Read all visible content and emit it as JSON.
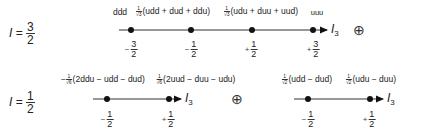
{
  "colors": {
    "line": "#333333",
    "dot": "#111111",
    "text": "#222222"
  },
  "row_i32": {
    "isospin_label": {
      "var": "I",
      "eq": "=",
      "num": "3",
      "den": "2"
    },
    "axis_label": {
      "var": "I",
      "sub": "3"
    },
    "states": [
      {
        "label": "ddd"
      },
      {
        "coef_num": "1",
        "coef_den": "√3",
        "label": "(udd + dud + ddu)"
      },
      {
        "coef_num": "1",
        "coef_den": "√3",
        "label": "(udu + duu + uud)"
      },
      {
        "label": "uuu"
      }
    ],
    "ticks": [
      {
        "sign": "−",
        "num": "3",
        "den": "2"
      },
      {
        "sign": "−",
        "num": "1",
        "den": "2"
      },
      {
        "sign": "+",
        "num": "1",
        "den": "2"
      },
      {
        "sign": "+",
        "num": "3",
        "den": "2"
      }
    ],
    "direct_sum": "⊕"
  },
  "row_i12": {
    "isospin_label": {
      "var": "I",
      "eq": "=",
      "num": "1",
      "den": "2"
    },
    "multiplet_a": {
      "axis_label": {
        "var": "I",
        "sub": "3"
      },
      "states": [
        {
          "prefix": "−",
          "coef_num": "1",
          "coef_den": "√6",
          "label": "(2ddu − udd − dud)"
        },
        {
          "coef_num": "1",
          "coef_den": "√6",
          "label": "(2uud − duu − udu)"
        }
      ],
      "ticks": [
        {
          "sign": "−",
          "num": "1",
          "den": "2"
        },
        {
          "sign": "+",
          "num": "1",
          "den": "2"
        }
      ]
    },
    "direct_sum": "⊕",
    "multiplet_b": {
      "axis_label": {
        "var": "I",
        "sub": "3"
      },
      "states": [
        {
          "coef_num": "1",
          "coef_den": "√2",
          "label": "(udd − dud)"
        },
        {
          "coef_num": "1",
          "coef_den": "√2",
          "label": "(udu − duu)"
        }
      ],
      "ticks": [
        {
          "sign": "−",
          "num": "1",
          "den": "2"
        },
        {
          "sign": "+",
          "num": "1",
          "den": "2"
        }
      ]
    }
  }
}
